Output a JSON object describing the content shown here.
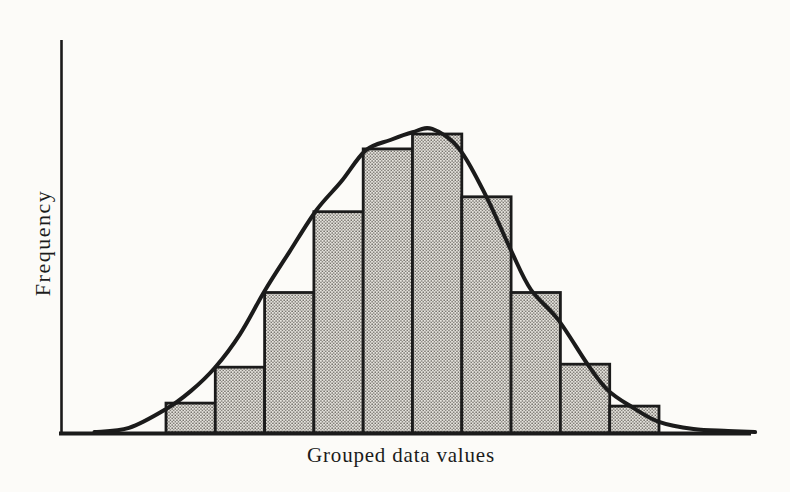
{
  "figure": {
    "ylabel": "Frequency",
    "xlabel": "Grouped data values"
  },
  "colors": {
    "ink": "#1b1b1b",
    "paper": "#fcfbf8",
    "bar_fill": "#e7e5df",
    "bar_dots": "#57534d"
  },
  "chart_data": {
    "type": "bar",
    "variant": "histogram with overlaid bell (normal) curve",
    "title": "",
    "xlabel": "Grouped data values",
    "ylabel": "Frequency",
    "x_tick_labels": [],
    "y_tick_labels": [],
    "grid": false,
    "legend": false,
    "bins": 10,
    "values": [
      10,
      22,
      47,
      74,
      95,
      100,
      79,
      47,
      23,
      9
    ],
    "value_scale": "percent of tallest bar; axes carry no numeric labels in the figure",
    "ylim": [
      0,
      105
    ],
    "bar_fill_style": "stippled halftone dots",
    "curve": {
      "name": "bell-curve",
      "x_units": "bin index (0 = left edge of first bar, 10 = right edge of last bar)",
      "points": [
        [
          -1.45,
          0.3
        ],
        [
          -0.75,
          1.7
        ],
        [
          0,
          8
        ],
        [
          0.5,
          14
        ],
        [
          1,
          22
        ],
        [
          1.5,
          33
        ],
        [
          2,
          47.5
        ],
        [
          2.5,
          60.5
        ],
        [
          3.05,
          74.5
        ],
        [
          3.55,
          84
        ],
        [
          4.05,
          94.5
        ],
        [
          4.55,
          98
        ],
        [
          5,
          100.6
        ],
        [
          5.4,
          101.7
        ],
        [
          5.95,
          95
        ],
        [
          6.5,
          79
        ],
        [
          7,
          61
        ],
        [
          7.4,
          48
        ],
        [
          7.95,
          38
        ],
        [
          8.55,
          23
        ],
        [
          8.95,
          14.5
        ],
        [
          9.45,
          8.7
        ],
        [
          10,
          3.7
        ],
        [
          10.7,
          1.3
        ],
        [
          11.4,
          0.7
        ],
        [
          11.95,
          0.3
        ]
      ]
    }
  }
}
